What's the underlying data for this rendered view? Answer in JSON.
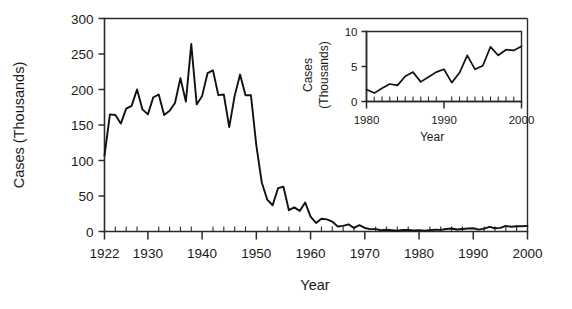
{
  "chart_data": [
    {
      "id": "main",
      "type": "line",
      "title": "",
      "xlabel": "Year",
      "ylabel": "Cases (Thousands)",
      "xlim": [
        1922,
        2000
      ],
      "ylim": [
        0,
        300
      ],
      "xticks": [
        1922,
        1930,
        1940,
        1950,
        1960,
        1970,
        1980,
        1990,
        2000
      ],
      "xticklabels": [
        "1922",
        "1930",
        "1940",
        "1950",
        "1960",
        "1970",
        "1980",
        "1990",
        "2000"
      ],
      "yticks": [
        0,
        50,
        100,
        150,
        200,
        250,
        300
      ],
      "yticklabels": [
        "0",
        "50",
        "100",
        "150",
        "200",
        "250",
        "300"
      ],
      "minor_tick_interval_x": 2,
      "grid": false,
      "legend": false,
      "series": [
        {
          "name": "Pertussis cases",
          "x": [
            1922,
            1923,
            1924,
            1925,
            1926,
            1927,
            1928,
            1929,
            1930,
            1931,
            1932,
            1933,
            1934,
            1935,
            1936,
            1937,
            1938,
            1939,
            1940,
            1941,
            1942,
            1943,
            1944,
            1945,
            1946,
            1947,
            1948,
            1949,
            1950,
            1951,
            1952,
            1953,
            1954,
            1955,
            1956,
            1957,
            1958,
            1959,
            1960,
            1961,
            1962,
            1963,
            1964,
            1965,
            1966,
            1967,
            1968,
            1969,
            1970,
            1971,
            1972,
            1973,
            1974,
            1975,
            1976,
            1977,
            1978,
            1979,
            1980,
            1981,
            1982,
            1983,
            1984,
            1985,
            1986,
            1987,
            1988,
            1989,
            1990,
            1991,
            1992,
            1993,
            1994,
            1995,
            1996,
            1997,
            1998,
            1999,
            2000
          ],
          "y": [
            107,
            165,
            164,
            152,
            173,
            177,
            200,
            172,
            165,
            189,
            193,
            164,
            170,
            181,
            216,
            183,
            264,
            179,
            191,
            223,
            227,
            192,
            193,
            147,
            191,
            221,
            192,
            192,
            121,
            69,
            45,
            37,
            61,
            63,
            30,
            34,
            29,
            41,
            21,
            12,
            18,
            17,
            14,
            7,
            8,
            10,
            5,
            9,
            5,
            3.3,
            3.3,
            1.8,
            2.4,
            1.7,
            1.0,
            2.2,
            2.1,
            1.6,
            1.7,
            1.2,
            1.9,
            2.5,
            2.3,
            3.6,
            4.2,
            2.8,
            3.5,
            4.2,
            4.6,
            2.7,
            4.1,
            6.6,
            4.6,
            5.1,
            7.8,
            6.6,
            7.4,
            7.3,
            7.9
          ]
        }
      ]
    },
    {
      "id": "inset",
      "type": "line",
      "title": "",
      "xlabel": "Year",
      "ylabel": "Cases (Thousands)",
      "xlim": [
        1980,
        2000
      ],
      "ylim": [
        0,
        10
      ],
      "xticks": [
        1980,
        1990,
        2000
      ],
      "xticklabels": [
        "1980",
        "1990",
        "2000"
      ],
      "yticks": [
        0,
        5,
        10
      ],
      "yticklabels": [
        "0",
        "5",
        "10"
      ],
      "minor_tick_interval_x": 1,
      "grid": false,
      "legend": false,
      "series": [
        {
          "name": "Pertussis cases (1980-2000)",
          "x": [
            1980,
            1981,
            1982,
            1983,
            1984,
            1985,
            1986,
            1987,
            1988,
            1989,
            1990,
            1991,
            1992,
            1993,
            1994,
            1995,
            1996,
            1997,
            1998,
            1999,
            2000
          ],
          "y": [
            1.7,
            1.2,
            1.9,
            2.5,
            2.3,
            3.6,
            4.2,
            2.8,
            3.5,
            4.2,
            4.6,
            2.7,
            4.1,
            6.6,
            4.6,
            5.1,
            7.8,
            6.6,
            7.4,
            7.3,
            7.9
          ]
        }
      ]
    }
  ],
  "main_axis": {
    "xlabel": "Year",
    "ylabel": "Cases (Thousands)",
    "xticklabels": [
      "1922",
      "1930",
      "1940",
      "1950",
      "1960",
      "1970",
      "1980",
      "1990",
      "2000"
    ],
    "yticklabels": [
      "0",
      "50",
      "100",
      "150",
      "200",
      "250",
      "300"
    ]
  },
  "inset_axis": {
    "xlabel": "Year",
    "ylabel_line1": "Cases",
    "ylabel_line2": "(Thousands)",
    "xticklabels": [
      "1980",
      "1990",
      "2000"
    ],
    "yticklabels": [
      "0",
      "5",
      "10"
    ]
  },
  "colors": {
    "line": "#111111",
    "axis": "#2b2b2b",
    "background": "#ffffff",
    "text": "#1a1a1a"
  }
}
